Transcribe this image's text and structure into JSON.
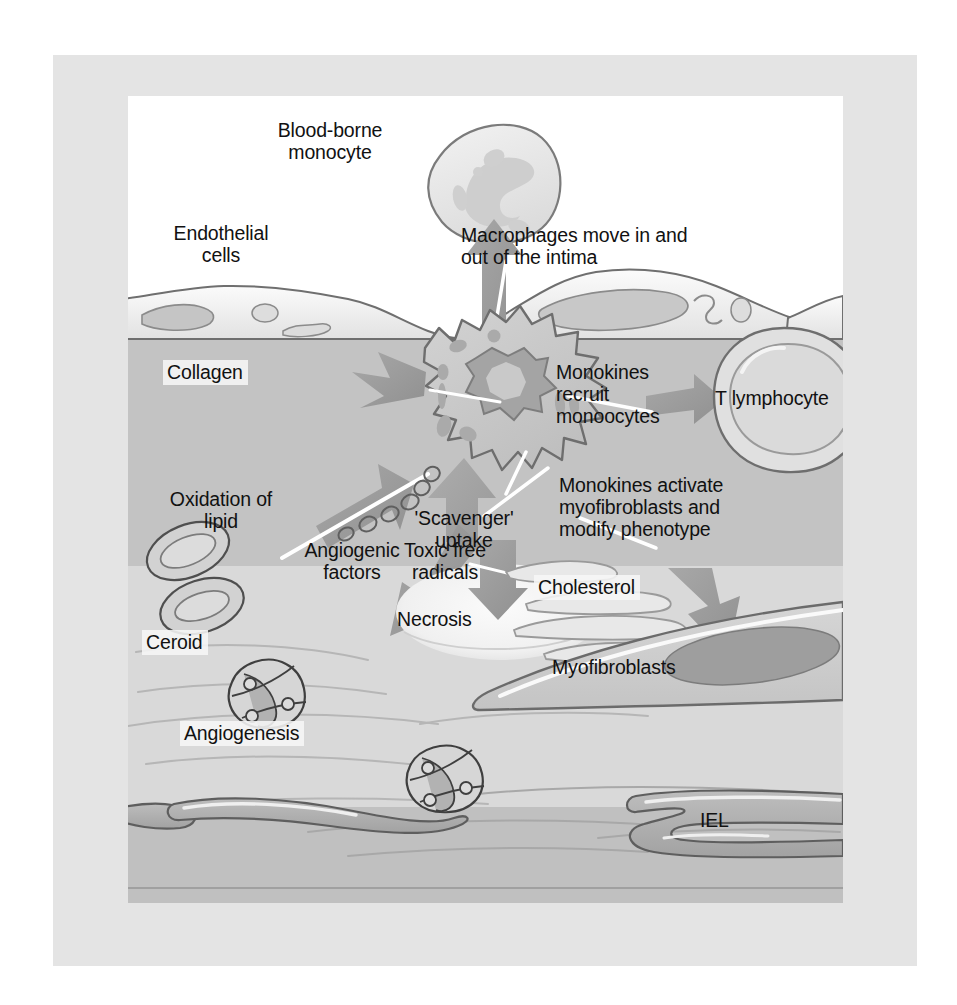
{
  "figure": {
    "panel_background": "#ffffff",
    "frame_color": "#e4e4e4"
  },
  "layers": [
    {
      "name": "lumen",
      "label_shown": false,
      "color": "#ffffff"
    },
    {
      "name": "endothelium",
      "label_shown": true,
      "color": "#ededed"
    },
    {
      "name": "intima",
      "label_shown": false,
      "color": "#c3c3c3"
    },
    {
      "name": "plaque-core",
      "label_shown": false,
      "color": "#d9d9d9"
    },
    {
      "name": "internal-elastic-lamina",
      "label_shown": true,
      "color": "#a9a9a9"
    },
    {
      "name": "media",
      "label_shown": false,
      "color": "#c0c0c0"
    }
  ],
  "labels": {
    "blood_borne_monocyte": "Blood-borne\nmonocyte",
    "endothelial_cells": "Endothelial\ncells",
    "macrophages_move": "Macrophages move in and\nout of the intima",
    "collagen": "Collagen",
    "monokines_recruit": "Monokines\nrecruit\nmonoocytes",
    "t_lymphocyte": "T lymphocyte",
    "monokines_activate": "Monokines activate\nmyofibroblasts and\nmodify phenotype",
    "oxidation_of_lipid": "Oxidation of\nlipid",
    "scavenger_uptake": "'Scavenger'\nuptake",
    "toxic_free_radicals": "Toxic free\nradicals",
    "angiogenic_factors": "Angiogenic\nfactors",
    "cholesterol": "Cholesterol",
    "ceroid": "Ceroid",
    "necrosis": "Necrosis",
    "angiogenesis": "Angiogenesis",
    "myofibroblasts": "Myofibroblasts",
    "iel": "IEL"
  },
  "cells": {
    "monocyte": {
      "name": "Blood-borne monocyte",
      "nucleus": "kidney-shaped"
    },
    "macrophage": {
      "name": "Activated macrophage",
      "nucleus": "lobulated"
    },
    "t_lymphocyte": {
      "name": "T lymphocyte",
      "nucleus": "round"
    },
    "capillary": {
      "name": "Angiogenic capillary",
      "nuclei_count": 3
    },
    "ceroid_bodies": {
      "name": "Ceroid bodies",
      "count": 2
    },
    "myofibroblast": {
      "name": "Myofibroblast",
      "nucleus": "elongated spindle"
    }
  },
  "arrows": [
    {
      "name": "monocyte-egress",
      "from": "macrophage",
      "to": "blood-borne monocyte",
      "direction": "up"
    },
    {
      "name": "collagen-output",
      "from": "macrophage",
      "to": "collagen",
      "direction": "left"
    },
    {
      "name": "t-lymphocyte-recruit",
      "from": "macrophage",
      "to": "T lymphocyte",
      "direction": "right"
    },
    {
      "name": "myofibroblast-activate",
      "from": "macrophage",
      "to": "myofibroblasts",
      "direction": "down-right"
    },
    {
      "name": "lipid-oxidation",
      "from": "macrophage",
      "to": "ceroid",
      "direction": "down-left"
    },
    {
      "name": "angiogenic-factors",
      "from": "macrophage",
      "to": "angiogenesis",
      "direction": "down-left"
    },
    {
      "name": "scavenger-uptake",
      "from": "cholesterol",
      "to": "macrophage",
      "direction": "up"
    },
    {
      "name": "toxic-free-radicals",
      "from": "macrophage",
      "to": "necrosis",
      "direction": "down"
    }
  ]
}
